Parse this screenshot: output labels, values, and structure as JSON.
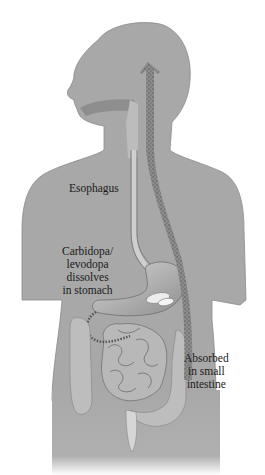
{
  "diagram": {
    "colors": {
      "body": "#a8a8a8",
      "body_outline": "#7a7a7a",
      "organ_light": "#c9c9c9",
      "organ_dark": "#8a8a8a",
      "stipple": "#6e6e6e",
      "background": "#ffffff",
      "text": "#1a1a1a"
    },
    "labels": {
      "esophagus": "Esophagus",
      "stomach": [
        "Carbidopa/",
        "levodopa",
        "dissolves",
        "in stomach"
      ],
      "intestine": [
        "Absorbed",
        "in small",
        "intestine"
      ]
    },
    "elements": [
      "head-silhouette",
      "torso-silhouette",
      "oral-cavity",
      "esophagus",
      "stomach",
      "pill-in-stomach",
      "small-intestine",
      "large-intestine",
      "absorption-arrow-to-brain"
    ]
  }
}
